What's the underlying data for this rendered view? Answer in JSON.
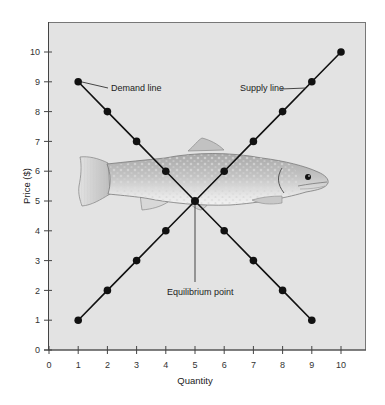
{
  "chart_data": {
    "type": "line",
    "title": "",
    "xlabel": "Quantity",
    "ylabel": "Price ($)",
    "xlim": [
      0,
      11
    ],
    "ylim": [
      0,
      11
    ],
    "x_ticks": [
      0,
      1,
      2,
      3,
      4,
      5,
      6,
      7,
      8,
      9,
      10
    ],
    "y_ticks": [
      0,
      1,
      2,
      3,
      4,
      5,
      6,
      7,
      8,
      9,
      10
    ],
    "grid": false,
    "background_color": "#e3e3e3",
    "series": [
      {
        "name": "Demand line",
        "x": [
          1,
          2,
          3,
          4,
          5,
          6,
          7,
          8,
          9
        ],
        "values": [
          9,
          8,
          7,
          6,
          5,
          4,
          3,
          2,
          1
        ],
        "color": "#111111",
        "marker": "circle"
      },
      {
        "name": "Supply line",
        "x": [
          1,
          2,
          3,
          4,
          5,
          6,
          7,
          8,
          9,
          10
        ],
        "values": [
          1,
          2,
          3,
          4,
          5,
          6,
          7,
          8,
          9,
          10
        ],
        "color": "#111111",
        "marker": "circle"
      }
    ],
    "annotations": [
      {
        "text": "Demand line",
        "target": [
          1,
          9
        ],
        "position": "right of point"
      },
      {
        "text": "Supply line",
        "target": [
          9,
          9
        ],
        "position": "left of point"
      },
      {
        "text": "Equilibrium point",
        "target": [
          5,
          5
        ],
        "position": "below, leader line"
      }
    ],
    "illustration": "trout fish drawn behind the intersection"
  },
  "labels": {
    "xlabel": "Quantity",
    "ylabel": "Price ($)",
    "demand": "Demand line",
    "supply": "Supply line",
    "equilibrium": "Equilibrium point"
  }
}
